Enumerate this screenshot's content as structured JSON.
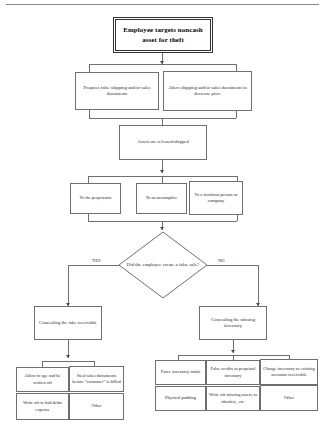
{
  "diagram": {
    "type": "flowchart",
    "title_text": "Employee targets noncash asset for theft",
    "nodes": {
      "root": "Employee targets noncash asset for theft",
      "method_left": "Prepares false shipping and/or sales documents",
      "method_right": "Alters shipping and/or sales documents to decrease price",
      "assets_released": "Assets are released/shipped",
      "dest_1": "To the perpetrator",
      "dest_2": "To an accomplice",
      "dest_3": "To a fictitious person or company",
      "decision": "Did the employee create a false sale?",
      "yes_branch": "Concealing the fake receivable",
      "no_branch": "Concealing the missing inventory",
      "yes_leaf_1": "Allow to age and be written off",
      "yes_leaf_2": "Steal sales documents before \"customer\" is billed",
      "yes_leaf_3": "Write off to bad debts expense",
      "yes_leaf_4": "Other",
      "no_leaf_1": "Force inventory totals",
      "no_leaf_2": "False credits to perpetual inventory",
      "no_leaf_3": "Charge inventory to existing accounts receivable",
      "no_leaf_4": "Physical padding",
      "no_leaf_5": "Write off missing assets as obsolete, etc.",
      "no_leaf_6": "Other"
    },
    "edge_labels": {
      "yes": "YES",
      "no": "NO"
    },
    "colors": {
      "line": "#6f6f6f",
      "box_border": "#6f6f6f",
      "root_border": "#333333",
      "text": "#2b2b2b",
      "background": "#ffffff"
    }
  }
}
